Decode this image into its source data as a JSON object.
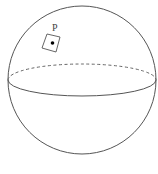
{
  "figure": {
    "point_label": "P",
    "caption": "",
    "stroke_color": "#555555",
    "dash_color": "#666666",
    "point_color": "#000000"
  }
}
